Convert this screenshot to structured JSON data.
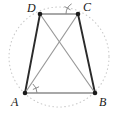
{
  "figure": {
    "canvas": {
      "width": 118,
      "height": 118,
      "background": "#ffffff"
    },
    "colors": {
      "circle": "#c9c9c9",
      "side_dark": "#2b2b2b",
      "side_light": "#8c8c8c",
      "diagonal": "#9a9a9a",
      "vertex_dot": "#1a1a1a",
      "angle_mark": "#8c8c8c",
      "label": "#1a1a1a"
    },
    "circle": {
      "name": "circumcircle",
      "cx": 59,
      "cy": 57,
      "r": 50,
      "style": "dotted",
      "stroke_width": 1.1,
      "dash": "0.6 3.4"
    },
    "vertices": [
      {
        "id": "D",
        "label": "D",
        "x": 40,
        "y": 14,
        "label_x": 27,
        "label_y": 2,
        "dot_r": 2.3
      },
      {
        "id": "C",
        "label": "C",
        "x": 78,
        "y": 14,
        "label_x": 83,
        "label_y": 1,
        "dot_r": 2.3
      },
      {
        "id": "A",
        "label": "A",
        "x": 25,
        "y": 93,
        "label_x": 11,
        "label_y": 96,
        "dot_r": 2.3
      },
      {
        "id": "B",
        "label": "B",
        "x": 95,
        "y": 93,
        "label_x": 99,
        "label_y": 96,
        "dot_r": 2.3
      }
    ],
    "edges": [
      {
        "id": "DC",
        "from": "D",
        "to": "C",
        "role": "top-side",
        "color": "#8c8c8c",
        "width": 1.3
      },
      {
        "id": "AB",
        "from": "A",
        "to": "B",
        "role": "bottom-side",
        "color": "#8c8c8c",
        "width": 1.3
      },
      {
        "id": "DA",
        "from": "D",
        "to": "A",
        "role": "left-leg",
        "color": "#2b2b2b",
        "width": 1.9
      },
      {
        "id": "CB",
        "from": "C",
        "to": "B",
        "role": "right-leg",
        "color": "#2b2b2b",
        "width": 1.9
      }
    ],
    "diagonals": [
      {
        "id": "AC",
        "from": "A",
        "to": "C",
        "color": "#9a9a9a",
        "width": 1.2
      },
      {
        "id": "DB",
        "from": "D",
        "to": "B",
        "color": "#9a9a9a",
        "width": 1.2
      }
    ],
    "diagonal_intersection": {
      "x": 59,
      "y": 45
    },
    "angle_marks": [
      {
        "id": "angle-A",
        "at": "A",
        "between": [
          "AB",
          "AC"
        ],
        "vertex_x": 25,
        "vertex_y": 93,
        "radius": 12,
        "start_deg": 0,
        "end_deg": -49,
        "tick_deg": -24,
        "tick_inner": 9,
        "tick_outer": 15,
        "color": "#8c8c8c"
      },
      {
        "id": "angle-C",
        "at": "C",
        "between": [
          "CD",
          "CA"
        ],
        "vertex_x": 78,
        "vertex_y": 14,
        "radius": 12,
        "start_deg": 180,
        "end_deg": 238,
        "tick_deg": 209,
        "tick_inner": 9,
        "tick_outer": 15,
        "color": "#8c8c8c"
      }
    ]
  }
}
